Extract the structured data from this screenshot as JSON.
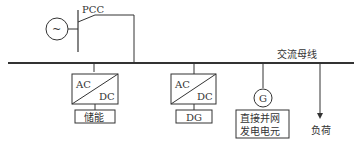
{
  "diagram": {
    "pcc_label": "PCC",
    "grid_source_symbol": "~",
    "bus_label": "交流母线",
    "converter1": {
      "ac": "AC",
      "dc": "DC",
      "load_label": "储能"
    },
    "converter2": {
      "ac": "AC",
      "dc": "DC",
      "load_label": "DG"
    },
    "generator": {
      "symbol": "G",
      "label_line1": "直接并网",
      "label_line2": "发电电元"
    },
    "load": {
      "label": "负荷"
    },
    "colors": {
      "line": "#333333",
      "background": "#ffffff"
    }
  }
}
